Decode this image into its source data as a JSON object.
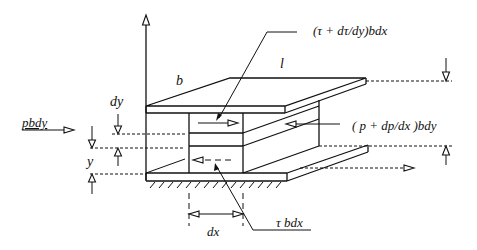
{
  "diagram": {
    "labels": {
      "shear_top": "(τ + dτ/dy)bdx",
      "width_b": "b",
      "length_l": "l",
      "dy": "dy",
      "pressure_left": "pbdy",
      "pressure_right": "( p + dp/dx )bdy",
      "y": "y",
      "dx": "dx",
      "shear_bottom": "τ bdx"
    },
    "colors": {
      "ink": "#111111",
      "background": "#ffffff"
    }
  }
}
